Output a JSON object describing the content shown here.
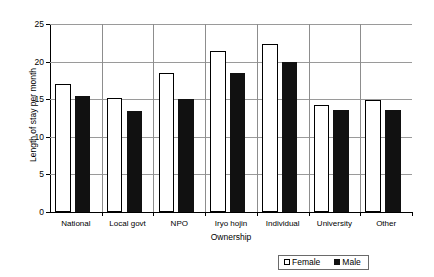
{
  "chart_data": {
    "type": "bar",
    "title": "",
    "xlabel": "Ownership",
    "ylabel": "Length of stay per month",
    "categories": [
      "National",
      "Local govt",
      "NPO",
      "Iryo hojin",
      "Individual",
      "University",
      "Other"
    ],
    "series": [
      {
        "name": "Female",
        "values": [
          17.0,
          15.2,
          18.5,
          21.4,
          22.4,
          14.2,
          14.9
        ],
        "color": "#ffffff"
      },
      {
        "name": "Male",
        "values": [
          15.4,
          13.4,
          15.0,
          18.5,
          20.0,
          13.6,
          13.5
        ],
        "color": "#111111"
      }
    ],
    "ylim": [
      0,
      25
    ],
    "yticks": [
      0,
      5,
      10,
      15,
      20,
      25
    ],
    "ytick_labels": [
      "0",
      "5",
      "10",
      "15",
      "20",
      "25"
    ],
    "grid": true,
    "grid_axis": "y",
    "legend_position": "bottom-right",
    "legend_entries": [
      "Female",
      "Male"
    ]
  }
}
